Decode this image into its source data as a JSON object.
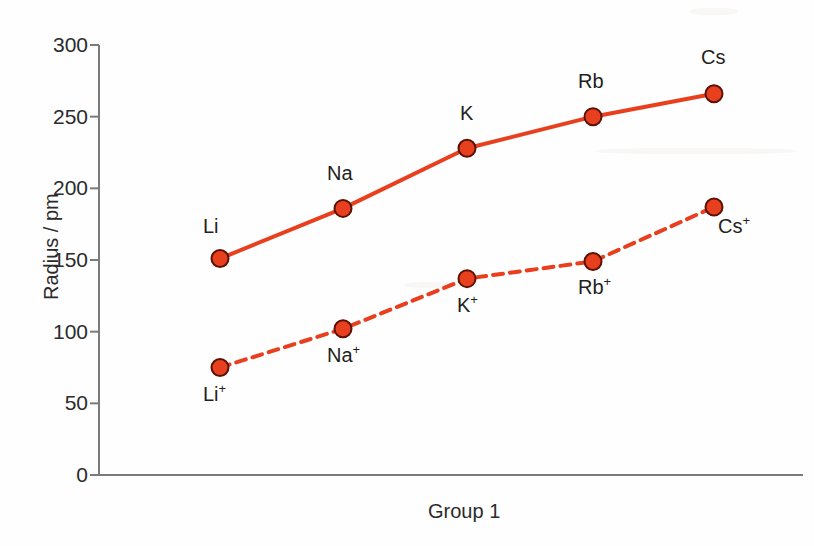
{
  "figure": {
    "background_color": "#fefefe",
    "axis_color": "#7a7a7a",
    "text_color": "#231f20"
  },
  "chart_data": {
    "type": "line",
    "title": "",
    "subtitle": "",
    "xlabel": "Group 1",
    "ylabel": "Radius / pm",
    "ylim": [
      0,
      300
    ],
    "yticks": [
      0,
      50,
      100,
      150,
      200,
      250,
      300
    ],
    "ytick_labels": [
      "0",
      "50",
      "100",
      "150",
      "200",
      "250",
      "300"
    ],
    "grid": false,
    "legend": "none",
    "categories": [
      "Li",
      "Na",
      "K",
      "Rb",
      "Cs"
    ],
    "series": [
      {
        "name": "Atomic radius",
        "line_style": "solid",
        "color": "#e8401f",
        "marker": "circle",
        "marker_color": "#e8401f",
        "marker_edge_color": "#5a1205",
        "point_labels": [
          "Li",
          "Na",
          "K",
          "Rb",
          "Cs"
        ],
        "values": [
          151,
          186,
          228,
          250,
          266
        ]
      },
      {
        "name": "Ionic radius",
        "line_style": "dashed",
        "color": "#e8401f",
        "marker": "circle",
        "marker_color": "#e8401f",
        "marker_edge_color": "#5a1205",
        "point_labels": [
          "Li+",
          "Na+",
          "K+",
          "Rb+",
          "Cs+"
        ],
        "values": [
          75,
          102,
          137,
          149,
          187
        ]
      }
    ]
  },
  "axis": {
    "y_title": "Radius / pm",
    "x_title": "Group 1",
    "ticks": [
      {
        "label": "300",
        "value": 300
      },
      {
        "label": "250",
        "value": 250
      },
      {
        "label": "200",
        "value": 200
      },
      {
        "label": "150",
        "value": 150
      },
      {
        "label": "100",
        "value": 100
      },
      {
        "label": "50",
        "value": 50
      },
      {
        "label": "0",
        "value": 0
      }
    ]
  },
  "atom_labels": [
    {
      "text": "Li",
      "sup": ""
    },
    {
      "text": "Na",
      "sup": ""
    },
    {
      "text": "K",
      "sup": ""
    },
    {
      "text": "Rb",
      "sup": ""
    },
    {
      "text": "Cs",
      "sup": ""
    }
  ],
  "ion_labels": [
    {
      "text": "Li",
      "sup": "+"
    },
    {
      "text": "Na",
      "sup": "+"
    },
    {
      "text": "K",
      "sup": "+"
    },
    {
      "text": "Rb",
      "sup": "+"
    },
    {
      "text": "Cs",
      "sup": "+"
    }
  ]
}
